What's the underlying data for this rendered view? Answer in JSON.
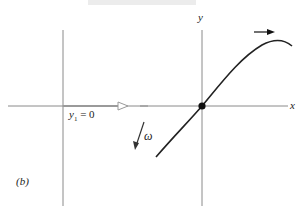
{
  "figure": {
    "panel_label": "(b)",
    "left_diagram": {
      "subscript_label": "y",
      "subscript": "1",
      "equation_rest": " = 0",
      "rotation_label": "ω"
    },
    "right_diagram": {
      "x_axis_label": "x",
      "y_axis_label": "y"
    },
    "colors": {
      "axis": "#888888",
      "curve": "#222222",
      "vector": "#999999"
    }
  }
}
